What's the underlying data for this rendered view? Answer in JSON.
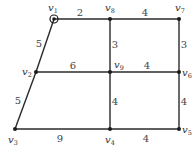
{
  "graph": {
    "vertices": [
      {
        "id": "v1",
        "name": "v",
        "sub": "1",
        "x": 54,
        "y": 19,
        "lx": 48,
        "ly": 11,
        "source": true
      },
      {
        "id": "v2",
        "name": "v",
        "sub": "2",
        "x": 36,
        "y": 72,
        "lx": 22,
        "ly": 75
      },
      {
        "id": "v3",
        "name": "v",
        "sub": "3",
        "x": 15,
        "y": 129,
        "lx": 8,
        "ly": 143
      },
      {
        "id": "v4",
        "name": "v",
        "sub": "4",
        "x": 110,
        "y": 129,
        "lx": 105,
        "ly": 143
      },
      {
        "id": "v5",
        "name": "v",
        "sub": "5",
        "x": 179,
        "y": 129,
        "lx": 182,
        "ly": 133
      },
      {
        "id": "v6",
        "name": "v",
        "sub": "6",
        "x": 179,
        "y": 72,
        "lx": 182,
        "ly": 76
      },
      {
        "id": "v7",
        "name": "v",
        "sub": "7",
        "x": 179,
        "y": 19,
        "lx": 175,
        "ly": 11
      },
      {
        "id": "v8",
        "name": "v",
        "sub": "8",
        "x": 110,
        "y": 19,
        "lx": 105,
        "ly": 11
      },
      {
        "id": "v9",
        "name": "v",
        "sub": "9",
        "x": 110,
        "y": 72,
        "lx": 114,
        "ly": 68
      }
    ],
    "edges": [
      {
        "from": "v1",
        "to": "v8",
        "weight": "2",
        "lx": 80,
        "ly": 16
      },
      {
        "from": "v8",
        "to": "v7",
        "weight": "4",
        "lx": 145,
        "ly": 16
      },
      {
        "from": "v1",
        "to": "v2",
        "weight": "5",
        "lx": 39,
        "ly": 47
      },
      {
        "from": "v2",
        "to": "v9",
        "weight": "6",
        "lx": 73,
        "ly": 69
      },
      {
        "from": "v9",
        "to": "v6",
        "weight": "4",
        "lx": 147,
        "ly": 69
      },
      {
        "from": "v8",
        "to": "v9",
        "weight": "3",
        "lx": 115,
        "ly": 48
      },
      {
        "from": "v7",
        "to": "v6",
        "weight": "3",
        "lx": 184,
        "ly": 48
      },
      {
        "from": "v2",
        "to": "v3",
        "weight": "5",
        "lx": 18,
        "ly": 104
      },
      {
        "from": "v3",
        "to": "v4",
        "weight": "9",
        "lx": 60,
        "ly": 142
      },
      {
        "from": "v4",
        "to": "v5",
        "weight": "4",
        "lx": 146,
        "ly": 142
      },
      {
        "from": "v9",
        "to": "v4",
        "weight": "4",
        "lx": 115,
        "ly": 105
      },
      {
        "from": "v6",
        "to": "v5",
        "weight": "4",
        "lx": 184,
        "ly": 105
      }
    ]
  }
}
